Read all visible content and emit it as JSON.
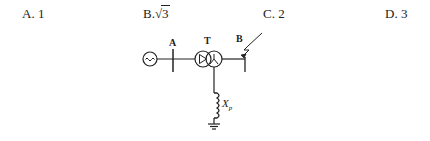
{
  "options": [
    {
      "letter": "A.",
      "value": "1"
    },
    {
      "letter": "B.",
      "value_prefix": "√",
      "value": "3"
    },
    {
      "letter": "C.",
      "value": "2"
    },
    {
      "letter": "D.",
      "value": "3"
    }
  ],
  "diagram": {
    "bus_a_label": "A",
    "transformer_label": "T",
    "bus_b_label": "B",
    "reactor_label_main": "X",
    "reactor_label_sub": "p",
    "generator_symbol": "~"
  }
}
